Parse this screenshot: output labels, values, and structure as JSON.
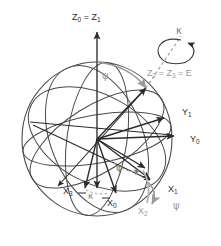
{
  "figure": {
    "colors": {
      "dark": "#2b2b2b",
      "gray": "#9a9a9a",
      "midgray": "#7d7d7d",
      "sphere_outline": "#4a4a4a",
      "background": "#ffffff"
    },
    "sphere": {
      "center_x": 97,
      "center_y": 139,
      "radius_x": 75,
      "radius_y": 77
    },
    "origin": {
      "x": 97,
      "y": 139
    }
  },
  "labels": [
    {
      "id": "z0z1",
      "base": "Z",
      "sub": "0",
      "tail": " = Z",
      "tail_sub": "1",
      "text": "Z0 = Z1",
      "color": "dark",
      "x": 72,
      "y": 18
    },
    {
      "id": "kappa_top",
      "text": "κ",
      "color": "midgray",
      "x": 176,
      "y": 31
    },
    {
      "id": "z2z3e",
      "text": "Z2 = Z3 = E",
      "color": "gray",
      "x": 147,
      "y": 74
    },
    {
      "id": "psi_top",
      "text": "ψ",
      "color": "gray",
      "x": 102,
      "y": 76
    },
    {
      "id": "y1",
      "text": "Y1",
      "color": "dark",
      "x": 182,
      "y": 113
    },
    {
      "id": "y0",
      "text": "Y0",
      "color": "dark",
      "x": 190,
      "y": 140
    },
    {
      "id": "phi",
      "text": "φ",
      "color": "midgray",
      "x": 116,
      "y": 168
    },
    {
      "id": "x3",
      "text": "X3",
      "color": "dark",
      "x": 63,
      "y": 192
    },
    {
      "id": "kappa_bottom",
      "text": "κ",
      "color": "midgray",
      "x": 88,
      "y": 196
    },
    {
      "id": "x0",
      "text": "X0",
      "color": "dark",
      "x": 107,
      "y": 204
    },
    {
      "id": "x1",
      "text": "X1",
      "color": "dark",
      "x": 168,
      "y": 190
    },
    {
      "id": "x2",
      "text": "X2",
      "color": "gray",
      "x": 138,
      "y": 212
    },
    {
      "id": "psi_bottom",
      "text": "ψ",
      "color": "gray",
      "x": 173,
      "y": 206
    }
  ],
  "axes": [
    {
      "name": "Z0 = Z1",
      "from": "origin",
      "to_x": 97,
      "to_y": 30,
      "color": "dark"
    },
    {
      "name": "Y0",
      "from": "origin",
      "to_x": 176,
      "to_y": 136,
      "color": "dark"
    },
    {
      "name": "Y1",
      "from": "origin",
      "to_x": 166,
      "to_y": 119,
      "color": "dark"
    },
    {
      "name": "X0",
      "from": "origin",
      "to_x": 118,
      "to_y": 196,
      "color": "dark"
    },
    {
      "name": "X1",
      "from": "origin",
      "to_x": 152,
      "to_y": 181,
      "color": "dark"
    },
    {
      "name": "X3",
      "from": "origin",
      "to_x": 84,
      "to_y": 190,
      "color": "dark"
    },
    {
      "name": "X2",
      "from": "origin",
      "to_x": 146,
      "to_y": 171,
      "color": "dark"
    },
    {
      "name": "E (Z2=Z3)",
      "from": "origin",
      "to_x": 147,
      "to_y": 86,
      "color": "dark"
    },
    {
      "name": "Z-down",
      "from": "origin",
      "to_x": 97,
      "to_y": 191,
      "color": "dark"
    }
  ],
  "arcs": [
    {
      "name": "psi-arc-top",
      "color": "gray"
    },
    {
      "name": "psi-arc-bottom",
      "color": "gray"
    },
    {
      "name": "phi-arc",
      "color": "gray"
    },
    {
      "name": "kappa-arc",
      "color": "midgray"
    },
    {
      "name": "kappa-spin",
      "color": "dark"
    }
  ]
}
